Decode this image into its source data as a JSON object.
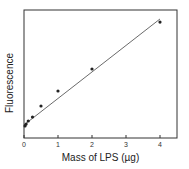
{
  "chart_data": {
    "type": "scatter",
    "title": "",
    "xlabel": "Mass of LPS (µg)",
    "ylabel": "Fluorescence",
    "xlim": [
      0,
      4.5
    ],
    "ylim": [
      0,
      100
    ],
    "x_ticks": [
      0,
      1,
      2,
      3,
      4
    ],
    "y_ticks": [],
    "grid": false,
    "legend": null,
    "series": [
      {
        "name": "measured",
        "type": "scatter",
        "x": [
          0.03,
          0.0625,
          0.125,
          0.25,
          0.5,
          1.0,
          2.0,
          4.0
        ],
        "y": [
          9.4,
          10.9,
          13.3,
          16.4,
          25.0,
          36.7,
          53.9,
          90.6
        ]
      },
      {
        "name": "linear fit",
        "type": "line",
        "x": [
          0,
          4.0
        ],
        "y": [
          10.2,
          93.0
        ]
      }
    ]
  },
  "labels": {
    "xlabel": "Mass of LPS (µg)",
    "ylabel": "Fluorescence"
  }
}
